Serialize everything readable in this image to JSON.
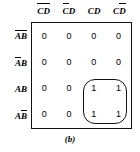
{
  "figure": {
    "caption": "(b)",
    "type": "karnaugh-map",
    "ink_color": "#111111",
    "background_color": "#ffffff"
  },
  "columns": [
    {
      "text": "CD",
      "c_bar": true,
      "d_bar": true,
      "label": "C̅D̅"
    },
    {
      "text": "CD",
      "c_bar": true,
      "d_bar": false,
      "label": "C̅D"
    },
    {
      "text": "CD",
      "c_bar": false,
      "d_bar": false,
      "label": "CD"
    },
    {
      "text": "CD",
      "c_bar": false,
      "d_bar": true,
      "label": "CD̅"
    }
  ],
  "rows": [
    {
      "text": "AB",
      "a_bar": true,
      "b_bar": true,
      "label": "A̅B̅"
    },
    {
      "text": "AB",
      "a_bar": true,
      "b_bar": false,
      "label": "A̅B"
    },
    {
      "text": "AB",
      "a_bar": false,
      "b_bar": false,
      "label": "AB"
    },
    {
      "text": "AB",
      "a_bar": false,
      "b_bar": true,
      "label": "AB̅"
    }
  ],
  "cells": [
    [
      "0",
      "0",
      "0",
      "0"
    ],
    [
      "0",
      "0",
      "0",
      "0"
    ],
    [
      "0",
      "0",
      "1",
      "1"
    ],
    [
      "0",
      "0",
      "1",
      "1"
    ]
  ],
  "group_loop": {
    "covers_rows": [
      "AB",
      "AB̅"
    ],
    "covers_columns": [
      "CD",
      "CD̅"
    ],
    "cell_count": 4
  },
  "chart_data": {
    "type": "table",
    "title": "(b)",
    "xlabel": "",
    "ylabel": "",
    "column_headers": [
      "C̅D̅",
      "C̅D",
      "CD",
      "CD̅"
    ],
    "row_headers": [
      "A̅B̅",
      "A̅B",
      "AB",
      "AB̅"
    ],
    "values": [
      [
        0,
        0,
        0,
        0
      ],
      [
        0,
        0,
        0,
        0
      ],
      [
        0,
        0,
        1,
        1
      ],
      [
        0,
        0,
        1,
        1
      ]
    ],
    "annotations": [
      "grouping loop around four 1s spanning rows AB, AB̅ and columns CD, CD̅"
    ],
    "grid": true,
    "legend": "none"
  }
}
